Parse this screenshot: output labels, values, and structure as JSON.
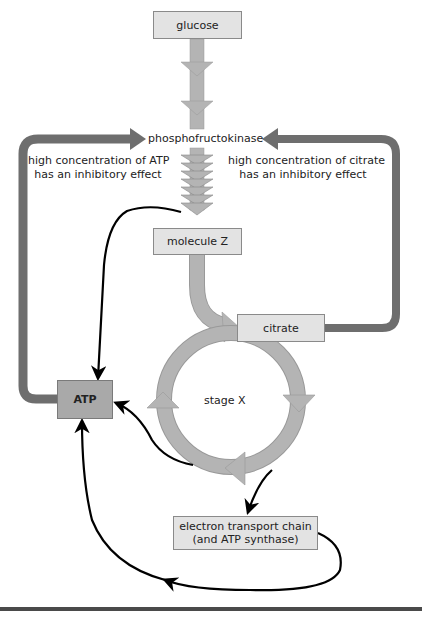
{
  "diagram": {
    "type": "metabolic-pathway",
    "nodes": {
      "glucose": {
        "label": "glucose"
      },
      "enzyme": {
        "label": "phosphofructokinase"
      },
      "molecule_z": {
        "label": "molecule Z"
      },
      "citrate": {
        "label": "citrate"
      },
      "stage_x": {
        "label": "stage X"
      },
      "atp": {
        "label": "ATP"
      },
      "etc_line1": {
        "label": "electron transport chain"
      },
      "etc_line2": {
        "label": "(and ATP synthase)"
      }
    },
    "annotations": {
      "atp_inhibition_line1": "high concentration of ATP",
      "atp_inhibition_line2": "has an inhibitory effect",
      "citrate_inhibition_line1": "high concentration of citrate",
      "citrate_inhibition_line2": "has an inhibitory effect"
    },
    "edges": [
      {
        "from": "glucose",
        "to": "phosphofructokinase",
        "style": "thick-grey-arrow"
      },
      {
        "from": "phosphofructokinase",
        "to": "molecule Z",
        "style": "stacked-chevrons"
      },
      {
        "from": "molecule Z",
        "to": "citrate",
        "style": "thick-grey-arrow"
      },
      {
        "from": "citrate",
        "to": "stage X cycle",
        "style": "circular-grey-arrows"
      },
      {
        "from": "citrate",
        "to": "phosphofructokinase",
        "style": "dark-feedback-arrow",
        "meaning": "inhibitory"
      },
      {
        "from": "ATP",
        "to": "phosphofructokinase",
        "style": "dark-feedback-arrow",
        "meaning": "inhibitory"
      },
      {
        "from": "phosphofructokinase step",
        "to": "ATP",
        "style": "black-curve"
      },
      {
        "from": "stage X",
        "to": "ATP",
        "style": "black-curve"
      },
      {
        "from": "stage X",
        "to": "electron transport chain",
        "style": "black-curve"
      },
      {
        "from": "electron transport chain",
        "to": "ATP",
        "style": "black-curve"
      }
    ],
    "colors": {
      "light_box": "#e3e3e3",
      "dark_box": "#a9a9a9",
      "flow_arrow": "#b4b4b4",
      "feedback_arrow": "#6e6e6e",
      "curve": "#000000",
      "rule": "#4a4a4a"
    }
  }
}
